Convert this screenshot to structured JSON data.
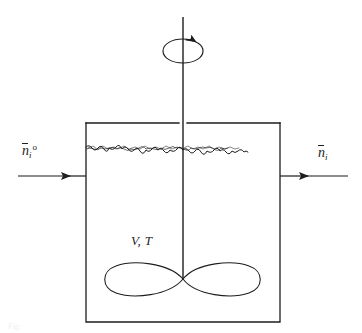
{
  "figure": {
    "kind": "stirred-tank-reactor-schematic",
    "background_color": "#ffffff",
    "line_color": "#1d1d1d"
  },
  "labels": {
    "inlet": {
      "symbol": "n",
      "overbar": true,
      "subscript": "i",
      "superscript": "o",
      "plain": "n̄i°"
    },
    "outlet": {
      "symbol": "n",
      "overbar": true,
      "subscript": "i",
      "superscript": "",
      "plain": "n̄i"
    },
    "contents": {
      "text": "V, T"
    },
    "caption_ghost": "Fig."
  },
  "geometry": {
    "tank": {
      "left": 86,
      "top": 123,
      "right": 280,
      "bottom": 322
    },
    "liquid_surface_y": 147,
    "shaft_x": 183,
    "shaft_top_y": 17,
    "shaft_bottom_y": 279,
    "flow_line_y": 176,
    "inlet_line": {
      "x_start": 18,
      "x_end": 86,
      "arrow_x": 70
    },
    "outlet_line": {
      "x_start": 280,
      "x_end": 348,
      "arrow_x": 308
    },
    "impeller": {
      "center_x": 183,
      "center_y": 279,
      "half_width": 75,
      "half_height": 16
    },
    "rotation_spiral": {
      "center_x": 183,
      "center_y": 48,
      "rx": 20,
      "ry": 12
    }
  },
  "parts": [
    {
      "name": "tank-vessel",
      "description": "rectangular open-top vessel outline"
    },
    {
      "name": "liquid-surface",
      "description": "agitated squiggly free-surface line"
    },
    {
      "name": "agitator-shaft",
      "description": "vertical stirrer shaft"
    },
    {
      "name": "impeller-blades",
      "description": "figure-eight / lemniscate impeller"
    },
    {
      "name": "rotation-arrow",
      "description": "spiral arrow indicating shaft rotation"
    },
    {
      "name": "inlet-stream-arrow",
      "description": "molar flow in"
    },
    {
      "name": "outlet-stream-arrow",
      "description": "molar flow out"
    }
  ]
}
